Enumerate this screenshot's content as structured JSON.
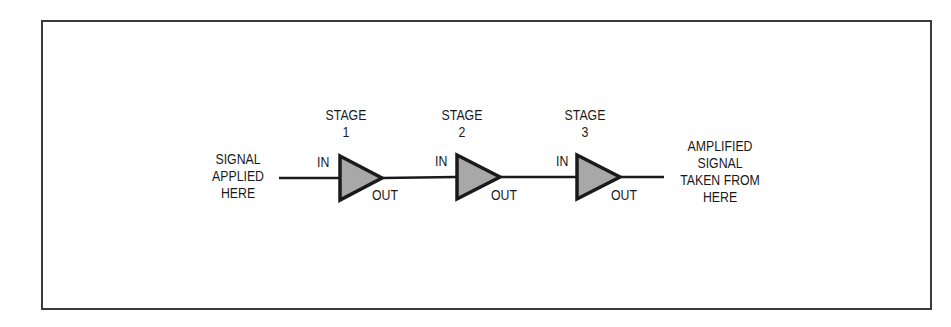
{
  "diagram": {
    "input_label": [
      "SIGNAL",
      "APPLIED",
      "HERE"
    ],
    "output_label": [
      "AMPLIFIED",
      "SIGNAL",
      "TAKEN FROM",
      "HERE"
    ],
    "stages": [
      {
        "title": "STAGE",
        "number": "1",
        "in_label": "IN",
        "out_label": "OUT"
      },
      {
        "title": "STAGE",
        "number": "2",
        "in_label": "IN",
        "out_label": "OUT"
      },
      {
        "title": "STAGE",
        "number": "3",
        "in_label": "IN",
        "out_label": "OUT"
      }
    ],
    "colors": {
      "line": "#1a1a1a",
      "amplifier_fill": "#a8a8a8",
      "frame": "#3a3a3a"
    }
  }
}
